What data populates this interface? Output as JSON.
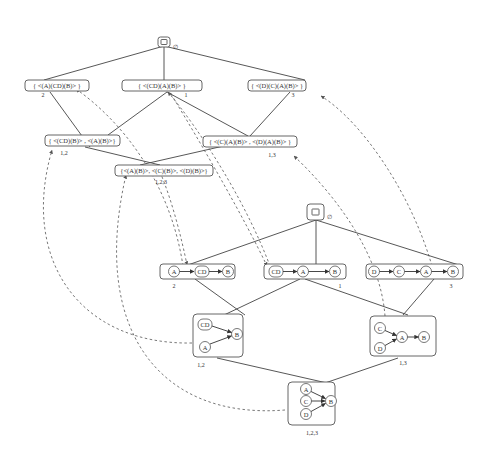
{
  "upper_lattice": {
    "root": {
      "symbol": "∅"
    },
    "level1": [
      {
        "label": "{ <(A)(CD)(B)> }",
        "index": "2"
      },
      {
        "label": "{ <(CD)(A)(B)> }",
        "index": "1"
      },
      {
        "label": "{ <(D)(C)(A)(B)> }",
        "index": "3"
      }
    ],
    "level2": [
      {
        "label": "{ <(CD)(B)> , <(A)(B)>}",
        "index": "1,2"
      },
      {
        "label": "{ <(C)(A)(B)> , <(D)(A)(B)> }",
        "index": "1,3"
      }
    ],
    "level3": [
      {
        "label": "{<(A)(B)>, <(C)(B)>, <(D)(B)>}",
        "index": "1,2,3"
      }
    ]
  },
  "lower_lattice": {
    "root": {
      "symbol": "∅"
    },
    "level1": [
      {
        "index": "2",
        "nodes": [
          "A",
          "CD",
          "B"
        ]
      },
      {
        "index": "1",
        "nodes": [
          "CD",
          "A",
          "B"
        ]
      },
      {
        "index": "3",
        "nodes": [
          "D",
          "C",
          "A",
          "B"
        ]
      }
    ],
    "level2": [
      {
        "index": "1,2",
        "nodes": [
          "CD",
          "A",
          "B"
        ]
      },
      {
        "index": "1,3",
        "nodes": [
          "C",
          "D",
          "A",
          "B"
        ]
      }
    ],
    "level3": [
      {
        "index": "1,2,3",
        "nodes": [
          "A",
          "C",
          "D",
          "B"
        ]
      }
    ]
  }
}
